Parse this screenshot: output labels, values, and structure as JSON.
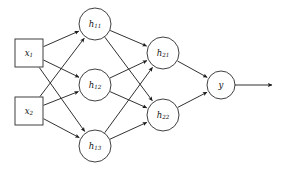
{
  "diagram": {
    "type": "neural-network",
    "title": "",
    "background_color": "#ffffff",
    "line_color": "#1a1a1a",
    "node_fill": "#ffffff",
    "node_stroke": "#2b2b2b",
    "layers": [
      {
        "name": "input-layer",
        "shape": "square",
        "nodes": [
          {
            "id": "x1",
            "base": "x",
            "sub": "1",
            "cx": 29,
            "cy": 53,
            "half": 14
          },
          {
            "id": "x2",
            "base": "x",
            "sub": "2",
            "cx": 29,
            "cy": 111,
            "half": 14
          }
        ]
      },
      {
        "name": "hidden-layer-1",
        "shape": "circle",
        "nodes": [
          {
            "id": "h11",
            "base": "h",
            "sub": "11",
            "cx": 95,
            "cy": 24,
            "r": 16
          },
          {
            "id": "h12",
            "base": "h",
            "sub": "12",
            "cx": 95,
            "cy": 85,
            "r": 16
          },
          {
            "id": "h13",
            "base": "h",
            "sub": "13",
            "cx": 95,
            "cy": 146,
            "r": 16
          }
        ]
      },
      {
        "name": "hidden-layer-2",
        "shape": "circle",
        "nodes": [
          {
            "id": "h21",
            "base": "h",
            "sub": "21",
            "cx": 163,
            "cy": 53,
            "r": 16
          },
          {
            "id": "h22",
            "base": "h",
            "sub": "22",
            "cx": 163,
            "cy": 115,
            "r": 16
          }
        ]
      },
      {
        "name": "output-layer",
        "shape": "circle",
        "nodes": [
          {
            "id": "y",
            "base": "y",
            "sub": "",
            "cx": 221,
            "cy": 85,
            "r": 14
          }
        ]
      }
    ],
    "edges": [
      {
        "from": "x1",
        "to": "h11"
      },
      {
        "from": "x1",
        "to": "h12"
      },
      {
        "from": "x1",
        "to": "h13"
      },
      {
        "from": "x2",
        "to": "h11"
      },
      {
        "from": "x2",
        "to": "h12"
      },
      {
        "from": "x2",
        "to": "h13"
      },
      {
        "from": "h11",
        "to": "h21"
      },
      {
        "from": "h11",
        "to": "h22"
      },
      {
        "from": "h12",
        "to": "h21"
      },
      {
        "from": "h12",
        "to": "h22"
      },
      {
        "from": "h13",
        "to": "h21"
      },
      {
        "from": "h13",
        "to": "h22"
      },
      {
        "from": "h21",
        "to": "y"
      },
      {
        "from": "h22",
        "to": "y"
      }
    ],
    "output_arrow": {
      "from_x": 235,
      "to_x": 272,
      "y": 85
    }
  }
}
